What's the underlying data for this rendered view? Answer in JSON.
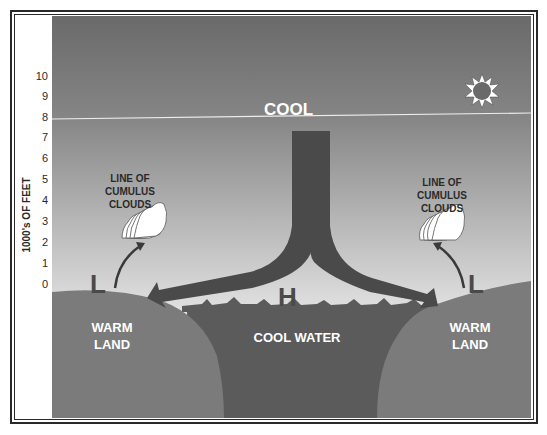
{
  "diagram": {
    "y_axis": {
      "label": "1000's OF FEET",
      "ticks": [
        "10",
        "9",
        "8",
        "7",
        "6",
        "5",
        "4",
        "3",
        "2",
        "1",
        "0"
      ]
    },
    "labels": {
      "cool": "COOL",
      "high": "H",
      "low_left": "L",
      "low_right": "L",
      "cloud_left_line1": "LINE OF",
      "cloud_left_line2": "CUMULUS",
      "cloud_left_line3": "CLOUDS",
      "cloud_right_line1": "LINE OF",
      "cloud_right_line2": "CUMULUS",
      "cloud_right_line3": "CLOUDS",
      "land_left_line1": "WARM",
      "land_left_line2": "LAND",
      "land_right_line1": "WARM",
      "land_right_line2": "LAND",
      "water": "COOL WATER"
    },
    "icons": {
      "sun": "sun-icon",
      "clouds": "cumulus-cloud-icon",
      "arrows": "airflow-arrow-icon"
    },
    "colors": {
      "sky_top": "#6e6e6e",
      "sky_bottom": "#e6e6e6",
      "land": "#7a7a7a",
      "water": "#5a5a5a",
      "airflow": "#4a4a4a",
      "frame": "#2a2a2a",
      "inversion_line": "#e8e8e8"
    }
  }
}
